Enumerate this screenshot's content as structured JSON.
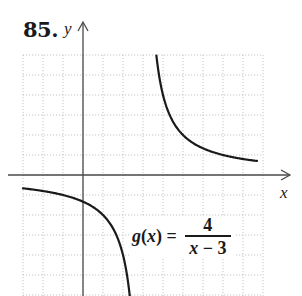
{
  "problem": {
    "number": "85."
  },
  "formula": {
    "lhs_func": "g",
    "lhs_paren_open": "(",
    "lhs_var": "x",
    "lhs_paren_close": ")",
    "equals": "=",
    "numerator": "4",
    "denominator_var": "x",
    "denominator_rest": " − 3"
  },
  "chart_data": {
    "type": "line",
    "title": "85.",
    "function": "g(x) = 4/(x - 3)",
    "xlabel": "x",
    "ylabel": "y",
    "xlim": [
      -3,
      10.3
    ],
    "ylim": [
      -6.05,
      7.65
    ],
    "grid": true,
    "grid_step": 1,
    "tick_labels": false,
    "vertical_asymptote": 3,
    "horizontal_asymptote": 0,
    "series": [
      {
        "name": "g(x) left branch",
        "domain": [
          -3,
          2.34
        ],
        "points": [
          [
            -3,
            -0.67
          ],
          [
            -2,
            -0.8
          ],
          [
            -1,
            -1
          ],
          [
            0,
            -1.33
          ],
          [
            1,
            -2
          ],
          [
            2,
            -4
          ],
          [
            2.34,
            -6.05
          ]
        ]
      },
      {
        "name": "g(x) right branch",
        "domain": [
          3.67,
          8.7
        ],
        "points": [
          [
            3.67,
            6
          ],
          [
            4,
            4
          ],
          [
            5,
            2
          ],
          [
            6,
            1.33
          ],
          [
            7,
            1
          ],
          [
            8,
            0.8
          ],
          [
            8.7,
            0.7
          ]
        ]
      }
    ],
    "colors": {
      "curve": "#1a1a1a",
      "axis": "#4a4a4a",
      "grid": "#b8b8b8"
    }
  }
}
